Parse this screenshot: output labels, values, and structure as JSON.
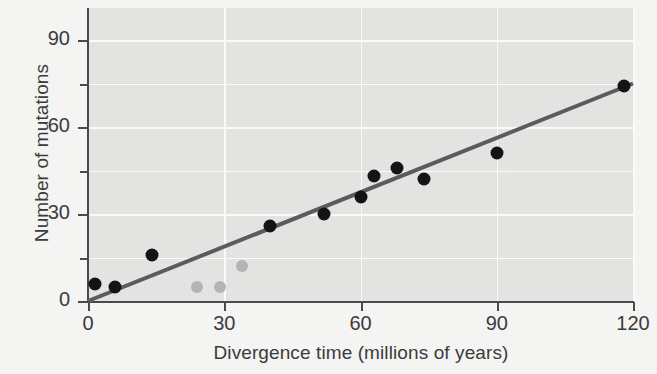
{
  "chart_data": {
    "type": "scatter",
    "title": "",
    "xlabel": "Divergence time (millions of years)",
    "ylabel": "Number of mutations",
    "xlim": [
      0,
      120
    ],
    "ylim": [
      0,
      98
    ],
    "xticks": [
      0,
      30,
      60,
      90,
      120
    ],
    "yticks": [
      0,
      30,
      60,
      90
    ],
    "yticks_minor": [
      15,
      45,
      75
    ],
    "grid": true,
    "legend": "none",
    "series": [
      {
        "name": "primary-data",
        "marker": "filled-circle",
        "color": "#141414",
        "points": [
          {
            "x": 1.5,
            "y": 6
          },
          {
            "x": 6,
            "y": 5
          },
          {
            "x": 14,
            "y": 16
          },
          {
            "x": 40,
            "y": 26
          },
          {
            "x": 52,
            "y": 30
          },
          {
            "x": 60,
            "y": 36
          },
          {
            "x": 63,
            "y": 43
          },
          {
            "x": 68,
            "y": 46
          },
          {
            "x": 74,
            "y": 42
          },
          {
            "x": 90,
            "y": 51
          },
          {
            "x": 118,
            "y": 74
          }
        ]
      },
      {
        "name": "outlier-data",
        "marker": "filled-circle",
        "color": "#b4b4b4",
        "points": [
          {
            "x": 24,
            "y": 5
          },
          {
            "x": 29,
            "y": 5
          },
          {
            "x": 34,
            "y": 12
          }
        ]
      }
    ],
    "trendline": {
      "name": "regression-line",
      "color": "#5b5b5b",
      "x0": 0,
      "y0": 0,
      "x1": 120,
      "y1": 75
    },
    "colors": {
      "panel": "#e6e6e4",
      "background": "#f4f4f2",
      "axis": "#4a4a4a",
      "gridline": "#fafaf8",
      "text": "#3b3b3b"
    }
  }
}
